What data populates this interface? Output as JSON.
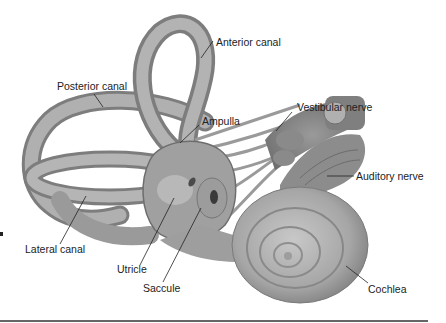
{
  "diagram": {
    "labels": {
      "anterior_canal": "Anterior canal",
      "posterior_canal": "Posterior canal",
      "ampulla": "Ampulla",
      "vestibular_nerve": "Vestibular nerve",
      "auditory_nerve": "Auditory nerve",
      "lateral_canal": "Lateral canal",
      "utricle": "Utricle",
      "saccule": "Saccule",
      "cochlea": "Cochlea"
    },
    "colors": {
      "tissue": "#a9a9a9",
      "tissue_light": "#cfcfcf",
      "tissue_dark": "#7a7a7a",
      "leader_line": "#222222",
      "text": "#222222"
    }
  }
}
